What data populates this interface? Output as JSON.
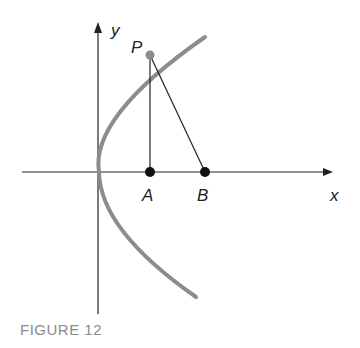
{
  "figure": {
    "caption": "FIGURE 12",
    "labels": {
      "y_axis": "y",
      "x_axis": "x",
      "point_p": "P",
      "point_a": "A",
      "point_b": "B"
    },
    "colors": {
      "parabola": "#8c8c8c",
      "axes": "#222222",
      "points": "#111111",
      "caption": "#8a8a8a"
    }
  }
}
